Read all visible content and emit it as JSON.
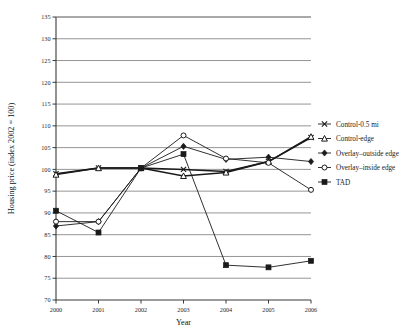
{
  "chart_data": {
    "type": "line",
    "title": "",
    "xlabel": "Year",
    "ylabel": "Housing price (index 2002 = 100)",
    "categories": [
      2000,
      2001,
      2002,
      2003,
      2004,
      2005,
      2006
    ],
    "xtick_labels": [
      "2000",
      "2001",
      "2002",
      "2003",
      "2004",
      "2005",
      "2006"
    ],
    "ytick_labels": [
      "70",
      "75",
      "80",
      "85",
      "90",
      "95",
      "100",
      "105",
      "110",
      "115",
      "120",
      "125",
      "130",
      "135"
    ],
    "ylim": [
      70,
      135
    ],
    "ytick_step": 5,
    "xlim": [
      2000,
      2006
    ],
    "grid": "horizontal",
    "legend_position": "right",
    "series": [
      {
        "name": "Control-0.5 mi",
        "marker": "x-cross",
        "values": [
          99.0,
          100.3,
          100.3,
          100.0,
          99.5,
          101.8,
          107.3
        ]
      },
      {
        "name": "Control-edge",
        "marker": "triangle-open",
        "values": [
          98.8,
          100.3,
          100.3,
          98.5,
          99.3,
          101.8,
          107.5
        ]
      },
      {
        "name": "Overlay–outside edge",
        "marker": "diamond-filled",
        "values": [
          87.0,
          88.0,
          100.3,
          105.3,
          102.3,
          102.8,
          101.8
        ]
      },
      {
        "name": "Overlay–inside edge",
        "marker": "circle-open",
        "values": [
          88.0,
          88.0,
          100.3,
          107.8,
          102.5,
          101.5,
          95.3
        ]
      },
      {
        "name": "TAD",
        "marker": "square-filled",
        "values": [
          90.5,
          85.5,
          100.3,
          103.5,
          78.0,
          77.5,
          79.0
        ]
      }
    ]
  },
  "legend": {
    "items": [
      {
        "label": "Control-0.5 mi",
        "marker": "x-cross"
      },
      {
        "label": "Control-edge",
        "marker": "triangle-open"
      },
      {
        "label": "Overlay–outside edge",
        "marker": "diamond-filled"
      },
      {
        "label": "Overlay–inside edge",
        "marker": "circle-open"
      },
      {
        "label": "TAD",
        "marker": "square-filled"
      }
    ]
  },
  "colors": {
    "line": "#1a1a1a",
    "grid": "#7a7a7a",
    "axis": "#3a3a3a",
    "background": "#ffffff"
  }
}
